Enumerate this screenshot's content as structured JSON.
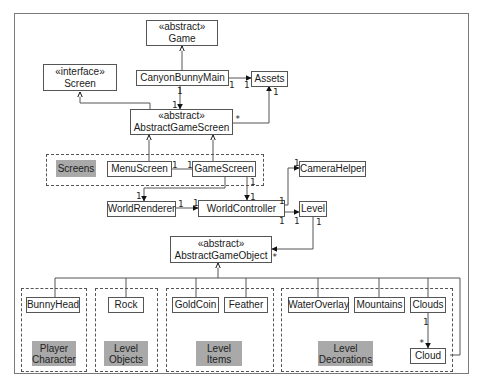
{
  "diagram": {
    "type": "UML class diagram",
    "classes": {
      "game": {
        "stereotype": "«abstract»",
        "name": "Game"
      },
      "screen": {
        "stereotype": "«interface»",
        "name": "Screen"
      },
      "canyon_bunny_main": {
        "name": "CanyonBunnyMain"
      },
      "assets": {
        "name": "Assets"
      },
      "abstract_game_screen": {
        "stereotype": "«abstract»",
        "name": "AbstractGameScreen"
      },
      "menu_screen": {
        "name": "MenuScreen"
      },
      "game_screen": {
        "name": "GameScreen"
      },
      "camera_helper": {
        "name": "CameraHelper"
      },
      "world_renderer": {
        "name": "WorldRenderer"
      },
      "world_controller": {
        "name": "WorldController"
      },
      "level": {
        "name": "Level"
      },
      "abstract_game_object": {
        "stereotype": "«abstract»",
        "name": "AbstractGameObject"
      },
      "bunny_head": {
        "name": "BunnyHead"
      },
      "rock": {
        "name": "Rock"
      },
      "gold_coin": {
        "name": "GoldCoin"
      },
      "feather": {
        "name": "Feather"
      },
      "water_overlay": {
        "name": "WaterOverlay"
      },
      "mountains": {
        "name": "Mountains"
      },
      "clouds": {
        "name": "Clouds"
      },
      "cloud": {
        "name": "Cloud"
      }
    },
    "groups": {
      "screens": {
        "label": "Screens"
      },
      "player_character": {
        "line1": "Player",
        "line2": "Character"
      },
      "level_objects": {
        "line1": "Level",
        "line2": "Objects"
      },
      "level_items": {
        "line1": "Level",
        "line2": "Items"
      },
      "level_decorations": {
        "line1": "Level",
        "line2": "Decorations"
      }
    },
    "multiplicities": {
      "one": "1",
      "many": "*"
    },
    "relationships": [
      {
        "from": "CanyonBunnyMain",
        "to": "Game",
        "kind": "generalization"
      },
      {
        "from": "CanyonBunnyMain",
        "to": "Assets",
        "kind": "association",
        "mult": [
          "1",
          "1"
        ]
      },
      {
        "from": "CanyonBunnyMain",
        "to": "AbstractGameScreen",
        "kind": "association",
        "mult": [
          "1",
          "1"
        ]
      },
      {
        "from": "AbstractGameScreen",
        "to": "Screen",
        "kind": "realization"
      },
      {
        "from": "AbstractGameScreen",
        "to": "Assets",
        "kind": "association",
        "mult": [
          "*",
          "1"
        ]
      },
      {
        "from": "MenuScreen",
        "to": "AbstractGameScreen",
        "kind": "generalization"
      },
      {
        "from": "GameScreen",
        "to": "AbstractGameScreen",
        "kind": "generalization"
      },
      {
        "from": "MenuScreen",
        "to": "GameScreen",
        "kind": "association",
        "mult": [
          "1",
          "1"
        ]
      },
      {
        "from": "GameScreen",
        "to": "WorldRenderer",
        "kind": "association",
        "mult": [
          "1"
        ]
      },
      {
        "from": "GameScreen",
        "to": "WorldController",
        "kind": "association",
        "mult": [
          "1",
          "1"
        ]
      },
      {
        "from": "WorldRenderer",
        "to": "WorldController",
        "kind": "association",
        "mult": [
          "1",
          "1"
        ]
      },
      {
        "from": "WorldController",
        "to": "CameraHelper",
        "kind": "association",
        "mult": [
          "1",
          "1"
        ]
      },
      {
        "from": "WorldController",
        "to": "Level",
        "kind": "association",
        "mult": [
          "1",
          "1"
        ]
      },
      {
        "from": "Level",
        "to": "AbstractGameObject",
        "kind": "association",
        "mult": [
          "1",
          "*"
        ]
      },
      {
        "from": "BunnyHead",
        "to": "AbstractGameObject",
        "kind": "generalization"
      },
      {
        "from": "Rock",
        "to": "AbstractGameObject",
        "kind": "generalization"
      },
      {
        "from": "GoldCoin",
        "to": "AbstractGameObject",
        "kind": "generalization"
      },
      {
        "from": "Feather",
        "to": "AbstractGameObject",
        "kind": "generalization"
      },
      {
        "from": "WaterOverlay",
        "to": "AbstractGameObject",
        "kind": "generalization"
      },
      {
        "from": "Mountains",
        "to": "AbstractGameObject",
        "kind": "generalization"
      },
      {
        "from": "Clouds",
        "to": "AbstractGameObject",
        "kind": "generalization"
      },
      {
        "from": "Cloud",
        "to": "AbstractGameObject",
        "kind": "generalization"
      },
      {
        "from": "Clouds",
        "to": "Cloud",
        "kind": "association",
        "mult": [
          "1",
          "*"
        ]
      }
    ]
  }
}
